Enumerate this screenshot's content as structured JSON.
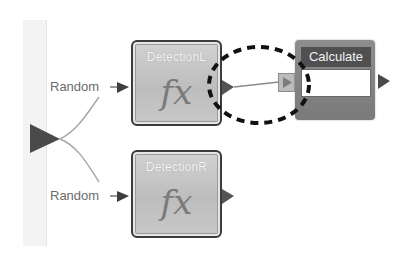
{
  "diagram": {
    "inputs": [
      {
        "label": "Random",
        "target": "DetectionL"
      },
      {
        "label": "Random",
        "target": "DetectionR"
      }
    ],
    "blocks": [
      {
        "id": "detection-l",
        "title": "DetectionL",
        "icon": "fx",
        "type": "function"
      },
      {
        "id": "detection-r",
        "title": "DetectionR",
        "icon": "fx",
        "type": "function"
      },
      {
        "id": "calculate",
        "title": "Calculate",
        "field_value": "",
        "type": "calculate"
      }
    ],
    "connections": [
      {
        "from": "split-port",
        "to": "detection-l",
        "via_label": "Random"
      },
      {
        "from": "split-port",
        "to": "detection-r",
        "via_label": "Random"
      },
      {
        "from": "detection-l",
        "to": "calculate"
      }
    ],
    "highlight": {
      "shape": "dashed-ellipse",
      "around": "detectionL-to-calculate-connection"
    },
    "colors": {
      "block_fill": "#c4c4c4",
      "block_border": "#3c3c3c",
      "calc_fill": "#808080",
      "calc_header": "#505050",
      "port": "#4a4a4a",
      "wire": "#9a9a9a",
      "highlight": "#111111"
    }
  }
}
